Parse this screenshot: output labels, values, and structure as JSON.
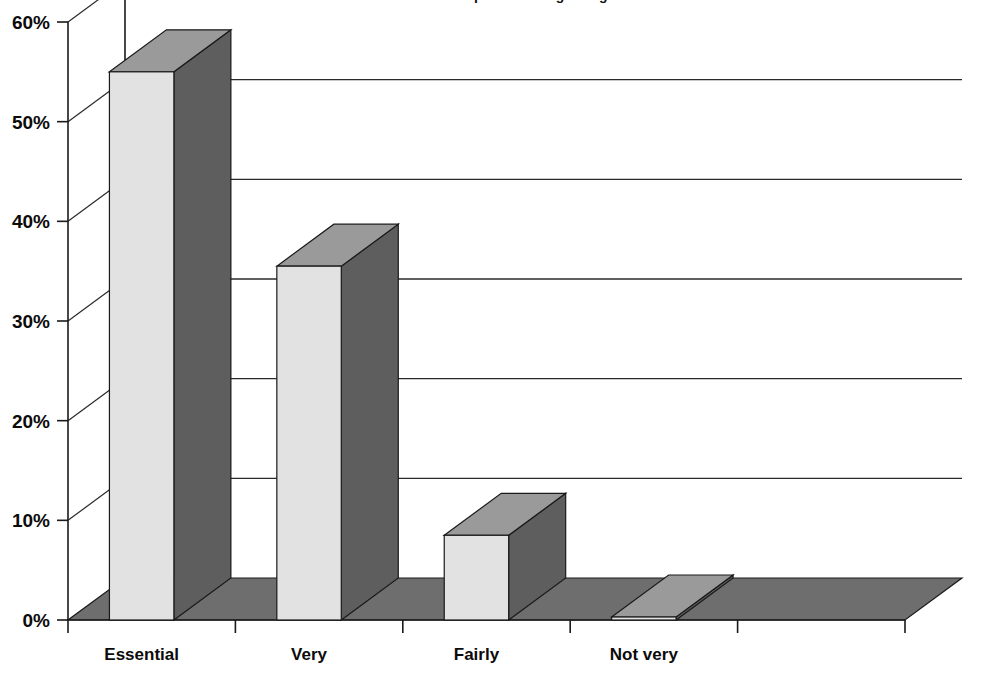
{
  "chart_data": {
    "type": "bar",
    "title": "...find it as important as agreeing",
    "title_note": "cropped at top edge of image",
    "categories": [
      "Essential",
      "Very",
      "Fairly",
      "Not very",
      ""
    ],
    "values": [
      55,
      35.5,
      8.5,
      0.3,
      0
    ],
    "value_labels": [
      "55%",
      "35.5%",
      "8.5%",
      "0%",
      ""
    ],
    "xlabel": "",
    "ylabel": "",
    "ylim": [
      0,
      60
    ],
    "ytick_values": [
      0,
      10,
      20,
      30,
      40,
      50,
      60
    ],
    "ytick_labels": [
      "0%",
      "10%",
      "20%",
      "30%",
      "40%",
      "50%",
      "60%"
    ],
    "grid": true,
    "legend": false,
    "style": "3d-column",
    "colors": {
      "bar_front": "#e2e2e2",
      "bar_top": "#9a9a9a",
      "bar_side": "#5e5e5e",
      "floor": "#6e6e6e",
      "axis": "#1a1a1a",
      "grid": "#2a2a2a",
      "background": "#ffffff",
      "text": "#0b0b0b"
    }
  }
}
